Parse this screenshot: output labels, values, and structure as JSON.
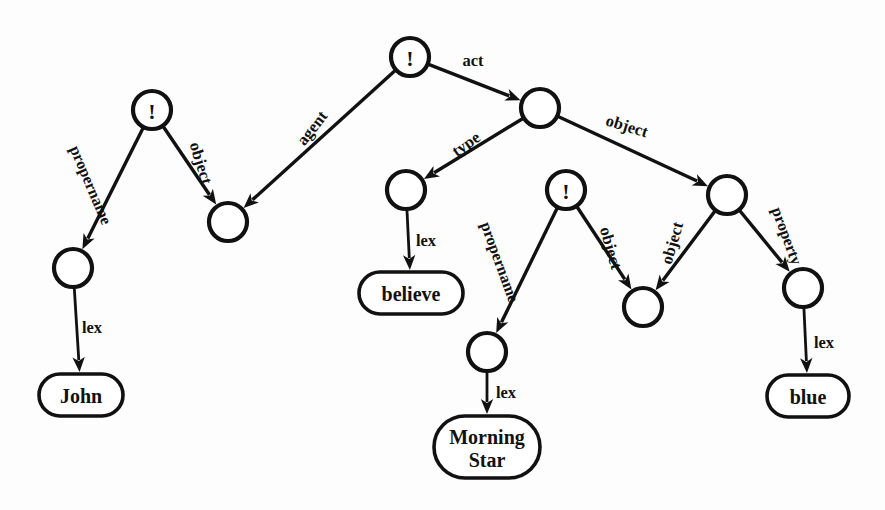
{
  "diagram": {
    "ink_color": "#111111",
    "background_color": "#fdfdfd",
    "nodes": [
      {
        "id": "n_root",
        "label": "!",
        "kind": "assertion-node",
        "cx": 410,
        "cy": 57,
        "r": 19
      },
      {
        "id": "n_act",
        "label": "",
        "kind": "plain-node",
        "cx": 540,
        "cy": 108,
        "r": 19
      },
      {
        "id": "n_john_prop",
        "label": "!",
        "kind": "assertion-node",
        "cx": 152,
        "cy": 110,
        "r": 19
      },
      {
        "id": "n_agent",
        "label": "",
        "kind": "plain-node",
        "cx": 228,
        "cy": 222,
        "r": 19
      },
      {
        "id": "n_john_lex",
        "label": "",
        "kind": "plain-node",
        "cx": 73,
        "cy": 268,
        "r": 19
      },
      {
        "id": "n_type",
        "label": "",
        "kind": "plain-node",
        "cx": 406,
        "cy": 190,
        "r": 19
      },
      {
        "id": "n_ms_prop",
        "label": "!",
        "kind": "assertion-node",
        "cx": 566,
        "cy": 190,
        "r": 19
      },
      {
        "id": "n_object",
        "label": "",
        "kind": "plain-node",
        "cx": 727,
        "cy": 195,
        "r": 19
      },
      {
        "id": "n_ms_lex",
        "label": "",
        "kind": "plain-node",
        "cx": 487,
        "cy": 352,
        "r": 19
      },
      {
        "id": "n_shared_obj",
        "label": "",
        "kind": "plain-node",
        "cx": 643,
        "cy": 307,
        "r": 19
      },
      {
        "id": "n_blue_lex",
        "label": "",
        "kind": "plain-node",
        "cx": 803,
        "cy": 288,
        "r": 19
      }
    ],
    "lex_boxes": [
      {
        "id": "b_john",
        "lines": [
          "John"
        ],
        "cx": 81,
        "cy": 395,
        "w": 84,
        "h": 42
      },
      {
        "id": "b_believe",
        "lines": [
          "believe"
        ],
        "cx": 411,
        "cy": 293,
        "w": 104,
        "h": 42
      },
      {
        "id": "b_ms",
        "lines": [
          "Morning",
          "Star"
        ],
        "cx": 487,
        "cy": 447,
        "w": 106,
        "h": 62
      },
      {
        "id": "b_blue",
        "lines": [
          "blue"
        ],
        "cx": 808,
        "cy": 396,
        "w": 82,
        "h": 42
      }
    ],
    "edges": [
      {
        "id": "e_act",
        "label": "act",
        "from": "n_root",
        "to": "n_act",
        "lx": 473,
        "ly": 60,
        "rot": 0
      },
      {
        "id": "e_agent",
        "label": "agent",
        "from": "n_root",
        "to": "n_agent",
        "lx": 312,
        "ly": 128,
        "rot": -52
      },
      {
        "id": "e_type",
        "label": "type",
        "from": "n_act",
        "to": "n_type",
        "lx": 466,
        "ly": 144,
        "rot": -35
      },
      {
        "id": "e_object_r",
        "label": "object",
        "from": "n_act",
        "to": "n_object",
        "lx": 627,
        "ly": 126,
        "rot": 17
      },
      {
        "id": "e_propname1",
        "label": "propername",
        "from": "n_john_prop",
        "to": "n_john_lex",
        "lx": 91,
        "ly": 185,
        "rot": 67
      },
      {
        "id": "e_object_l",
        "label": "object",
        "from": "n_john_prop",
        "to": "n_agent",
        "lx": 201,
        "ly": 163,
        "rot": 73
      },
      {
        "id": "e_lex_john",
        "label": "lex",
        "from": "n_john_lex",
        "to": "b_john",
        "lx": 92,
        "ly": 327,
        "rot": 0
      },
      {
        "id": "e_lex_bel",
        "label": "lex",
        "from": "n_type",
        "to": "b_believe",
        "lx": 426,
        "ly": 240,
        "rot": 0
      },
      {
        "id": "e_propname2",
        "label": "propername",
        "from": "n_ms_prop",
        "to": "n_ms_lex",
        "lx": 500,
        "ly": 262,
        "rot": 70
      },
      {
        "id": "e_object_m1",
        "label": "object",
        "from": "n_ms_prop",
        "to": "n_shared_obj",
        "lx": 611,
        "ly": 248,
        "rot": 74
      },
      {
        "id": "e_object_m2",
        "label": "object",
        "from": "n_object",
        "to": "n_shared_obj",
        "lx": 672,
        "ly": 243,
        "rot": -74
      },
      {
        "id": "e_property",
        "label": "property",
        "from": "n_object",
        "to": "n_blue_lex",
        "lx": 787,
        "ly": 236,
        "rot": 70
      },
      {
        "id": "e_lex_ms",
        "label": "lex",
        "from": "n_ms_lex",
        "to": "b_ms",
        "lx": 506,
        "ly": 392,
        "rot": 0
      },
      {
        "id": "e_lex_blue",
        "label": "lex",
        "from": "n_blue_lex",
        "to": "b_blue",
        "lx": 824,
        "ly": 342,
        "rot": 0
      }
    ]
  }
}
